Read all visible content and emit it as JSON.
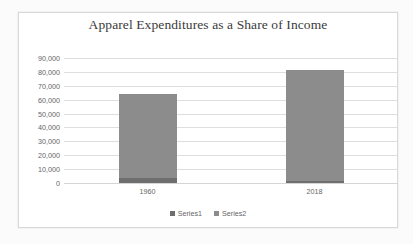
{
  "chart_data": {
    "type": "bar",
    "subtype": "stacked-column",
    "title": "Apparel Expenditures as a Share of Income",
    "xlabel": "",
    "ylabel": "",
    "categories": [
      "1960",
      "2018"
    ],
    "series": [
      {
        "name": "Series1",
        "values": [
          3600,
          1400
        ],
        "color": "#6e6e6e"
      },
      {
        "name": "Series2",
        "values": [
          60800,
          80300
        ],
        "color": "#8c8c8c"
      }
    ],
    "stacked_totals": [
      64400,
      81700
    ],
    "ylim": [
      0,
      90000
    ],
    "ytick_step": 10000,
    "ytick_labels": [
      "0",
      "10,000",
      "20,000",
      "30,000",
      "40,000",
      "50,000",
      "60,000",
      "70,000",
      "80,000",
      "90,000"
    ],
    "ytick_values": [
      0,
      10000,
      20000,
      30000,
      40000,
      50000,
      60000,
      70000,
      80000,
      90000
    ],
    "grid": true,
    "grid_axis": "y",
    "legend_position": "bottom",
    "legend_entries": [
      "Series1",
      "Series2"
    ]
  },
  "colors": {
    "series1": "#6e6e6e",
    "series2": "#8c8c8c",
    "gridline": "#dedede",
    "tick_text": "#666666",
    "title_text": "#3a3a3a",
    "frame_border": "#d9d9d9",
    "chart_background": "#ffffff",
    "page_background": "#fbfbfb"
  }
}
